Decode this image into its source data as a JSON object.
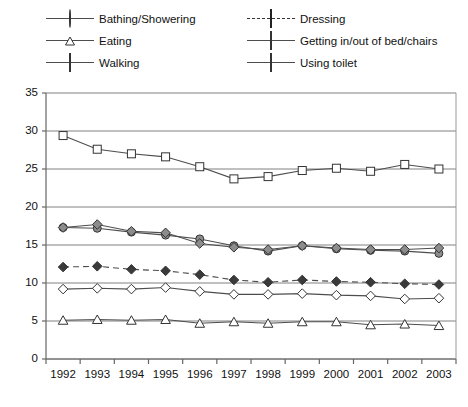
{
  "chart_data": {
    "type": "line",
    "title": "",
    "xlabel": "",
    "ylabel": "",
    "categories": [
      "1992",
      "1993",
      "1994",
      "1995",
      "1996",
      "1997",
      "1998",
      "1999",
      "2000",
      "2001",
      "2002",
      "2003"
    ],
    "ylim": [
      0,
      35
    ],
    "ytick_step": 5,
    "yticks": [
      "35",
      "30",
      "25",
      "20",
      "15",
      "10",
      "5",
      "0"
    ],
    "grid": "horizontal",
    "legend_position": "top",
    "series": [
      {
        "name": "Bathing/Showering",
        "marker": "circle-filled-gray",
        "line": "solid",
        "values": [
          17.3,
          17.2,
          16.7,
          16.3,
          15.8,
          14.9,
          14.2,
          14.9,
          14.5,
          14.3,
          14.2,
          13.9
        ]
      },
      {
        "name": "Dressing",
        "marker": "diamond-filled-dark",
        "line": "dashed",
        "values": [
          12.1,
          12.2,
          11.8,
          11.6,
          11.1,
          10.4,
          10.1,
          10.4,
          10.2,
          10.1,
          9.9,
          9.8
        ]
      },
      {
        "name": "Eating",
        "marker": "triangle-open",
        "line": "solid",
        "values": [
          5.1,
          5.2,
          5.1,
          5.2,
          4.7,
          4.9,
          4.7,
          4.9,
          4.9,
          4.5,
          4.6,
          4.4
        ]
      },
      {
        "name": "Getting in/out of bed/chairs",
        "marker": "diamond-filled-gray",
        "line": "solid",
        "values": [
          17.3,
          17.7,
          16.8,
          16.6,
          15.2,
          14.7,
          14.4,
          14.9,
          14.6,
          14.4,
          14.4,
          14.6
        ]
      },
      {
        "name": "Walking",
        "marker": "square-open",
        "line": "solid",
        "values": [
          29.4,
          27.6,
          27.0,
          26.6,
          25.3,
          23.7,
          24.0,
          24.8,
          25.1,
          24.7,
          25.6,
          25.0
        ]
      },
      {
        "name": "Using toilet",
        "marker": "diamond-open",
        "line": "solid",
        "values": [
          9.2,
          9.3,
          9.2,
          9.4,
          8.9,
          8.5,
          8.5,
          8.6,
          8.4,
          8.3,
          7.9,
          8.0
        ]
      }
    ]
  },
  "legend": {
    "columns": [
      [
        {
          "label": "Bathing/Showering",
          "marker": "circle-filled-gray",
          "line": "solid"
        },
        {
          "label": "Eating",
          "marker": "triangle-open",
          "line": "solid"
        },
        {
          "label": "Walking",
          "marker": "square-open",
          "line": "solid"
        }
      ],
      [
        {
          "label": "Dressing",
          "marker": "diamond-filled-dark",
          "line": "dashed"
        },
        {
          "label": "Getting in/out of bed/chairs",
          "marker": "diamond-filled-gray",
          "line": "solid"
        },
        {
          "label": "Using toilet",
          "marker": "diamond-open",
          "line": "solid"
        }
      ]
    ]
  },
  "colors": {
    "axis": "#808080",
    "grid": "#808080",
    "line": "#4d4d4d",
    "marker_gray": "#8c8c8c",
    "marker_dark": "#3a3a3a",
    "marker_open": "#ffffff",
    "text": "#111111"
  }
}
